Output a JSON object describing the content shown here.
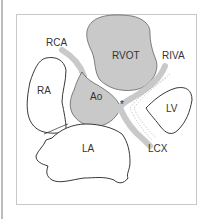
{
  "diagram": {
    "frame_color": "#c8c8c8",
    "gray_fill": "#c9c9c9",
    "outline_color": "#3a3a3a",
    "labels": {
      "rca": "RCA",
      "rvot": "RVOT",
      "riva": "RIVA",
      "ra": "RA",
      "ao": "Ao",
      "lv": "LV",
      "la": "LA",
      "lcx": "LCX",
      "asterisk": "*"
    },
    "structures": [
      {
        "id": "RCA",
        "name": "Right coronary artery",
        "style": "gray vessel"
      },
      {
        "id": "RVOT",
        "name": "Right ventricular outflow tract",
        "style": "gray filled"
      },
      {
        "id": "RIVA",
        "name": "Ramus interventricularis anterior",
        "style": "gray vessel"
      },
      {
        "id": "RA",
        "name": "Right atrium",
        "style": "outlined"
      },
      {
        "id": "Ao",
        "name": "Aorta",
        "style": "gray filled"
      },
      {
        "id": "LV",
        "name": "Left ventricle",
        "style": "outlined"
      },
      {
        "id": "LA",
        "name": "Left atrium",
        "style": "outlined"
      },
      {
        "id": "LCX",
        "name": "Left circumflex artery",
        "style": "gray vessel"
      }
    ]
  }
}
